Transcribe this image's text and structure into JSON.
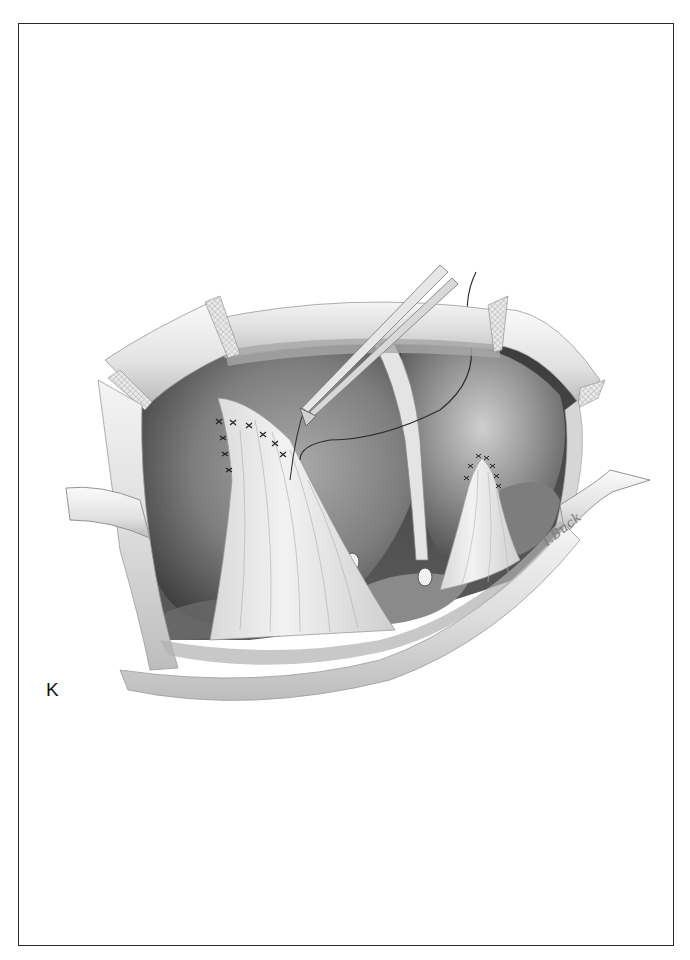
{
  "figure": {
    "panel_label": "K",
    "signature": "T.Buck",
    "palette": {
      "frame": "#2a2a2a",
      "background": "#ffffff",
      "organ_dark": "#5a5a5a",
      "organ_mid": "#8c8c8c",
      "organ_light": "#c8c8c8",
      "tissue": "#ececec",
      "suture": "#222222"
    }
  }
}
